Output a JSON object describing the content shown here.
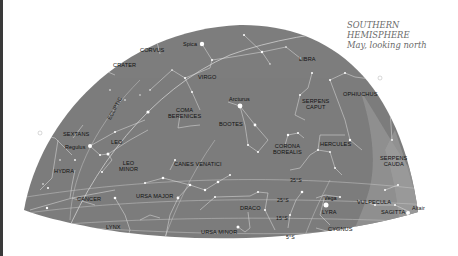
{
  "title": {
    "line1": "SOUTHERN",
    "line2": "HEMISPHERE",
    "line3": "May, looking north"
  },
  "colors": {
    "sky": "#7d7d7d",
    "milky_way": "#959595",
    "lines": "#d8d8d8",
    "stars": "#ffffff",
    "label_text": "#111111",
    "title_text": "#6a6a6a",
    "background": "#ffffff"
  },
  "constellations": [
    {
      "name": "CORVUS"
    },
    {
      "name": "CRATER"
    },
    {
      "name": "VIRGO"
    },
    {
      "name": "LIBRA"
    },
    {
      "name": "OPHIUCHUS"
    },
    {
      "name": "SERPENS CAPUT",
      "line1": "SERPENS",
      "line2": "CAPUT"
    },
    {
      "name": "COMA BERENICES",
      "line1": "COMA",
      "line2": "BERENICES"
    },
    {
      "name": "BOOTES"
    },
    {
      "name": "SEXTANS"
    },
    {
      "name": "LEO"
    },
    {
      "name": "LEO MINOR",
      "line1": "LEO",
      "line2": "MINOR"
    },
    {
      "name": "CANES VENATICI"
    },
    {
      "name": "CORONA BOREALIS",
      "line1": "CORONA",
      "line2": "BOREALIS"
    },
    {
      "name": "HERCULES"
    },
    {
      "name": "SERPENS CAUDA",
      "line1": "SERPENS",
      "line2": "CAUDA"
    },
    {
      "name": "HYDRA"
    },
    {
      "name": "CANCER"
    },
    {
      "name": "URSA MAJOR"
    },
    {
      "name": "DRACO"
    },
    {
      "name": "LYRA"
    },
    {
      "name": "VULPECULA"
    },
    {
      "name": "SAGITTA"
    },
    {
      "name": "LYNX"
    },
    {
      "name": "URSA MINOR"
    },
    {
      "name": "CYGNUS"
    }
  ],
  "labels": {
    "corvus": "CORVUS",
    "crater": "CRATER",
    "virgo": "VIRGO",
    "libra": "LIBRA",
    "ophiuchus": "OPHIUCHUS",
    "serpens_caput_1": "SERPENS",
    "serpens_caput_2": "CAPUT",
    "coma_1": "COMA",
    "coma_2": "BERENICES",
    "bootes": "BOOTES",
    "sextans": "SEXTANS",
    "leo": "LEO",
    "leo_minor_1": "LEO",
    "leo_minor_2": "MINOR",
    "canes": "CANES VENATICI",
    "corona_1": "CORONA",
    "corona_2": "BOREALIS",
    "hercules": "HERCULES",
    "serpens_cauda_1": "SERPENS",
    "serpens_cauda_2": "CAUDA",
    "hydra": "HYDRA",
    "cancer": "CANCER",
    "ursa_major": "URSA MAJOR",
    "draco": "DRACO",
    "lyra": "LYRA",
    "vulpecula": "VULPECULA",
    "sagitta": "SAGITTA",
    "lynx": "LYNX",
    "ursa_minor": "URSA MINOR",
    "cygnus": "CYGNUS",
    "ecliptic": "ECLIPTIC"
  },
  "stars": {
    "spica": "Spica",
    "arcturus": "Arcturus",
    "regulus": "Regulus",
    "vega": "Vega",
    "altair": "Altair"
  },
  "latitude_marks": {
    "lat35": "35°S",
    "lat25": "25°S",
    "lat15": "15°S",
    "lat5": "5°S"
  }
}
